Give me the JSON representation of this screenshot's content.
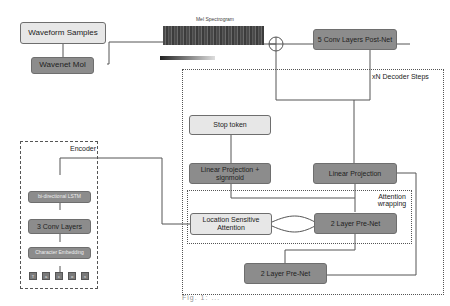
{
  "diagram": {
    "waveform_samples": "Waveform Samples",
    "wavenet_mol": "Wavenet Mol",
    "mel_spectrogram_title": "Mel Spectrogram",
    "postnet": "5 Conv  Layers Post-Net",
    "decoder_label": "xN Decoder Steps",
    "stop_token": "Stop token",
    "linear_projection_sigmoid": "Linear Projection + signmoid",
    "linear_projection": "Linear Projection",
    "attention_wrapping_label": "Attention wrapping",
    "location_sensitive_attention": "Location Sensitive Attention",
    "prenet_inner": "2 Layer Pre-Net",
    "prenet_outer": "2 Layer Pre-Net",
    "encoder_label": "Encoder",
    "bilstm": "bi-directional LSTM",
    "conv_layers": "3 Conv Layers",
    "char_embedding": "Character Embedding",
    "tokens": [
      "T",
      "a",
      "c",
      "o",
      "s"
    ],
    "caption": "Fig. 1: ..."
  },
  "colors": {
    "light_box": "#e7e7e7",
    "dark_box": "#8c8c8c",
    "line": "#555555"
  }
}
